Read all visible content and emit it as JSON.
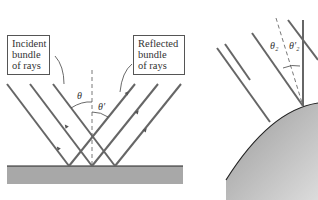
{
  "diagram": {
    "left_panel": {
      "incident_label": [
        "Incident",
        "bundle",
        "of rays"
      ],
      "reflected_label": [
        "Reflected",
        "bundle",
        "of rays"
      ],
      "angle_incident": "θ",
      "angle_reflected": "θ′",
      "surface": "flat reflecting surface"
    },
    "right_panel": {
      "angle_incident": "θ₂",
      "angle_reflected": "θ′₂",
      "surface": "curved reflecting surface"
    },
    "colors": {
      "ray": "#666666",
      "surface_fill": "#a8a8a8",
      "surface_line": "#222222",
      "normal": "#555555"
    }
  }
}
